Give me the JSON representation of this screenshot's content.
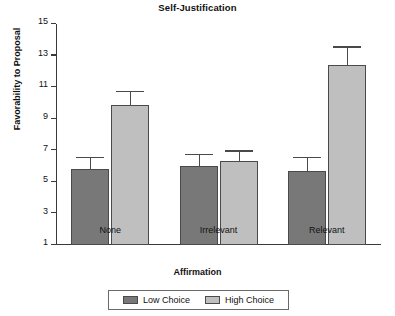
{
  "chart_data": {
    "type": "bar",
    "title": "Self-Justification",
    "xlabel": "Affirmation",
    "ylabel": "Favorability to Proposal",
    "categories": [
      "None",
      "Irrelevant",
      "Relevant"
    ],
    "ylim": [
      1,
      15
    ],
    "yticks": [
      1,
      3,
      5,
      7,
      9,
      11,
      13,
      15
    ],
    "grid": false,
    "legend_position": "bottom",
    "series": [
      {
        "name": "Low Choice",
        "color": "#787878",
        "values": [
          5.8,
          6.0,
          5.7
        ],
        "errors_upper": [
          6.5,
          6.7,
          6.5
        ],
        "errors_lower": [
          5.8,
          6.0,
          5.7
        ]
      },
      {
        "name": "High Choice",
        "color": "#bfbfbf",
        "values": [
          9.9,
          6.3,
          12.4
        ],
        "errors_upper": [
          10.7,
          6.9,
          13.5
        ],
        "errors_lower": [
          9.9,
          6.3,
          12.4
        ]
      }
    ]
  },
  "legend": {
    "entries": [
      {
        "label": "Low Choice",
        "swatch": "low"
      },
      {
        "label": "High Choice",
        "swatch": "high"
      }
    ]
  }
}
